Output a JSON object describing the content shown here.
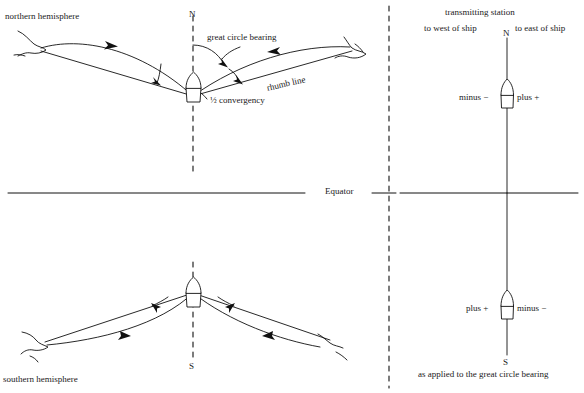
{
  "figure": {
    "stroke_color": "#111111",
    "background_color": "#ffffff"
  },
  "left_panel": {
    "north": {
      "hemisphere_label": "northern hemisphere",
      "meridian_label": "N",
      "great_circle_label": "great circle bearing",
      "rhumb_label": "rhumb line",
      "convergency_label": "½ convergency"
    },
    "equator_label": "Equator",
    "south": {
      "hemisphere_label": "southern hemisphere",
      "meridian_label": "S"
    }
  },
  "right_panel": {
    "title": "transmitting station",
    "west_label": "to west of ship",
    "east_label": "to east of ship",
    "north": {
      "cardinal": "N",
      "left_sign": "minus −",
      "right_sign": "plus +"
    },
    "south": {
      "cardinal": "S",
      "left_sign": "plus +",
      "right_sign": "minus −"
    },
    "caption": "as applied to the great circle bearing"
  }
}
